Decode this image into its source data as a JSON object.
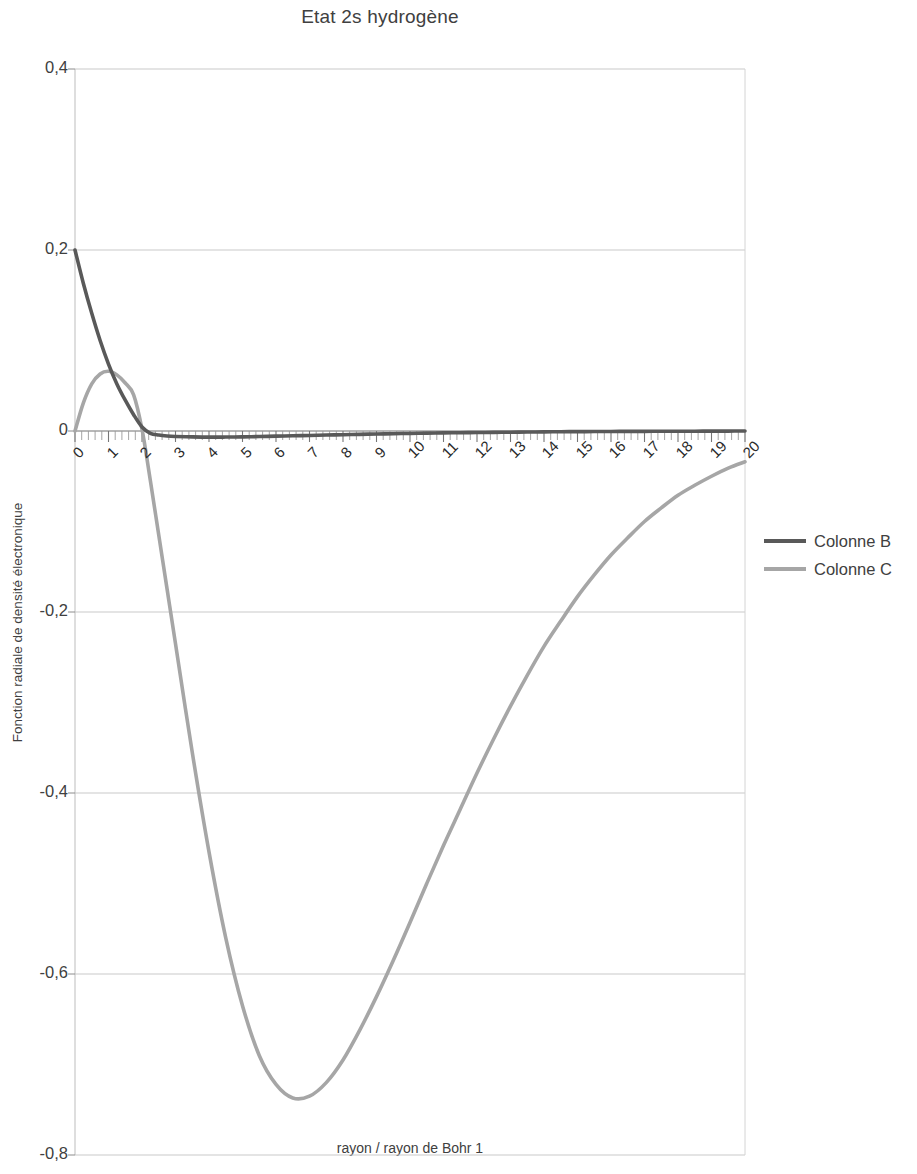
{
  "chart_data": {
    "type": "line",
    "title": "Etat 2s hydrogène",
    "xlabel": "rayon / rayon de Bohr 1",
    "ylabel": "Fonction radiale de densité électronique",
    "xlim": [
      0,
      20
    ],
    "ylim": [
      -0.8,
      0.4
    ],
    "grid": true,
    "legend_position": "right",
    "y_ticks": [
      "0,4",
      "0,2",
      "0",
      "-0,2",
      "-0,4",
      "-0,6",
      "-0,8"
    ],
    "y_tick_values": [
      0.4,
      0.2,
      0,
      -0.2,
      -0.4,
      -0.6,
      -0.8
    ],
    "x_ticks": [
      "0",
      "1",
      "2",
      "3",
      "4",
      "5",
      "6",
      "7",
      "8",
      "9",
      "10",
      "11",
      "12",
      "13",
      "14",
      "15",
      "16",
      "17",
      "18",
      "19",
      "20"
    ],
    "x": [
      0,
      0.25,
      0.5,
      0.75,
      1,
      1.25,
      1.5,
      1.75,
      2,
      2.25,
      2.5,
      2.75,
      3,
      3.5,
      4,
      4.5,
      5,
      5.5,
      6,
      6.5,
      7,
      7.5,
      8,
      8.5,
      9,
      9.5,
      10,
      10.5,
      11,
      11.5,
      12,
      12.5,
      13,
      13.5,
      14,
      14.5,
      15,
      15.5,
      16,
      16.5,
      17,
      17.5,
      18,
      18.5,
      19,
      19.5,
      20
    ],
    "series": [
      {
        "name": "Colonne B",
        "color": "#595959",
        "values": [
          0.2,
          0.163,
          0.13,
          0.1,
          0.074,
          0.052,
          0.034,
          0.018,
          0.0045,
          -0.0025,
          -0.0045,
          -0.0055,
          -0.006,
          -0.0065,
          -0.0068,
          -0.0067,
          -0.0065,
          -0.0061,
          -0.0057,
          -0.0053,
          -0.0049,
          -0.0045,
          -0.0041,
          -0.0037,
          -0.0033,
          -0.003,
          -0.0027,
          -0.0024,
          -0.0021,
          -0.0019,
          -0.0017,
          -0.0015,
          -0.0013,
          -0.0011,
          -0.001,
          -0.0008,
          -0.0007,
          -0.0006,
          -0.0005,
          -0.0004,
          -0.0004,
          -0.0003,
          -0.0002,
          -0.0002,
          -0.0001,
          -0.0001,
          0
        ]
      },
      {
        "name": "Colonne C",
        "color": "#a6a6a6",
        "values": [
          0,
          0.031,
          0.052,
          0.063,
          0.066,
          0.062,
          0.053,
          0.04,
          0.002,
          -0.055,
          -0.115,
          -0.175,
          -0.235,
          -0.355,
          -0.465,
          -0.56,
          -0.635,
          -0.69,
          -0.722,
          -0.737,
          -0.735,
          -0.72,
          -0.695,
          -0.662,
          -0.625,
          -0.585,
          -0.543,
          -0.5,
          -0.458,
          -0.418,
          -0.378,
          -0.34,
          -0.304,
          -0.27,
          -0.238,
          -0.21,
          -0.183,
          -0.159,
          -0.137,
          -0.118,
          -0.1,
          -0.085,
          -0.071,
          -0.06,
          -0.05,
          -0.041,
          -0.034
        ]
      }
    ]
  },
  "legend": {
    "entries": [
      {
        "label": "Colonne B"
      },
      {
        "label": "Colonne C"
      }
    ]
  }
}
